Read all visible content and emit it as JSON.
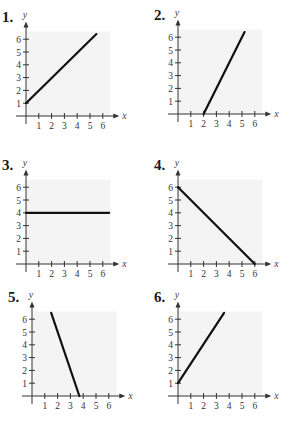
{
  "chart_data": [
    {
      "type": "line",
      "title": "1.",
      "xlabel": "x",
      "ylabel": "y",
      "xticks": [
        1,
        2,
        3,
        4,
        5,
        6
      ],
      "yticks": [
        1,
        2,
        3,
        4,
        5,
        6
      ],
      "xlim": [
        0,
        6.5
      ],
      "ylim": [
        0,
        6.5
      ],
      "segment": [
        [
          0,
          1
        ],
        [
          5.5,
          6.4
        ]
      ]
    },
    {
      "type": "line",
      "title": "2.",
      "xlabel": "x",
      "ylabel": "y",
      "xticks": [
        1,
        2,
        3,
        4,
        5,
        6
      ],
      "yticks": [
        1,
        2,
        3,
        4,
        5,
        6
      ],
      "xlim": [
        0,
        6.5
      ],
      "ylim": [
        0,
        6.5
      ],
      "segment": [
        [
          2,
          0
        ],
        [
          5.2,
          6.4
        ]
      ]
    },
    {
      "type": "line",
      "title": "3.",
      "xlabel": "x",
      "ylabel": "y",
      "xticks": [
        1,
        2,
        3,
        4,
        5,
        6
      ],
      "yticks": [
        1,
        2,
        3,
        4,
        5,
        6
      ],
      "xlim": [
        0,
        6.5
      ],
      "ylim": [
        0,
        6.5
      ],
      "segment": [
        [
          0,
          4
        ],
        [
          6.5,
          4
        ]
      ]
    },
    {
      "type": "line",
      "title": "4.",
      "xlabel": "x",
      "ylabel": "y",
      "xticks": [
        1,
        2,
        3,
        4,
        5,
        6
      ],
      "yticks": [
        1,
        2,
        3,
        4,
        5,
        6
      ],
      "xlim": [
        0,
        6.5
      ],
      "ylim": [
        0,
        6.5
      ],
      "segment": [
        [
          0,
          6
        ],
        [
          6,
          0
        ]
      ]
    },
    {
      "type": "line",
      "title": "5.",
      "xlabel": "x",
      "ylabel": "y",
      "xticks": [
        1,
        2,
        3,
        4,
        5,
        6
      ],
      "yticks": [
        1,
        2,
        3,
        4,
        5,
        6
      ],
      "xlim": [
        0,
        6.5
      ],
      "ylim": [
        0,
        6.5
      ],
      "segment": [
        [
          1.5,
          6.5
        ],
        [
          3.7,
          0
        ]
      ]
    },
    {
      "type": "line",
      "title": "6.",
      "xlabel": "x",
      "ylabel": "y",
      "xticks": [
        1,
        2,
        3,
        4,
        5,
        6
      ],
      "yticks": [
        1,
        2,
        3,
        4,
        5,
        6
      ],
      "xlim": [
        0,
        6.5
      ],
      "ylim": [
        0,
        6.5
      ],
      "segment": [
        [
          0,
          1
        ],
        [
          3.6,
          6.5
        ]
      ]
    }
  ],
  "graphs": [
    {
      "label": "1.",
      "origin": [
        26,
        116
      ]
    },
    {
      "label": "2.",
      "origin": [
        178,
        114
      ]
    },
    {
      "label": "3.",
      "origin": [
        26,
        264
      ]
    },
    {
      "label": "4.",
      "origin": [
        178,
        264
      ]
    },
    {
      "label": "5.",
      "origin": [
        32,
        396
      ]
    },
    {
      "label": "6.",
      "origin": [
        178,
        396
      ]
    }
  ]
}
